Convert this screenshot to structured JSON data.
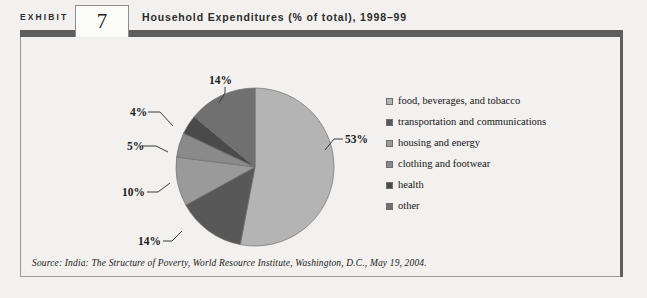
{
  "header": {
    "exhibit_word": "EXHIBIT",
    "exhibit_number": "7",
    "title": "Household Expenditures (% of total), 1998–99"
  },
  "source": {
    "text": "Source: India: The Structure of Poverty, World Resource Institute, Washington, D.C., May 19, 2004."
  },
  "colors": {
    "rule": "#5e5e5e",
    "frame_border": "#9a9a9a",
    "page_bg": "#f2f1ef",
    "text": "#1b1b1b",
    "slice_food": "#b4b4b4",
    "slice_transportation": "#585858",
    "slice_housing": "#9a9a9a",
    "slice_clothing": "#8a8a8a",
    "slice_health": "#4a4a4a",
    "slice_other": "#707070"
  },
  "chart_data": {
    "type": "pie",
    "title": "Household Expenditures (% of total), 1998–99",
    "legend_position": "right",
    "start_angle_deg": 0,
    "direction": "clockwise",
    "categories": [
      "food, beverages, and tobacco",
      "transportation and communications",
      "housing and energy",
      "clothing and footwear",
      "health",
      "other"
    ],
    "values": [
      53,
      14,
      10,
      5,
      4,
      14
    ],
    "value_labels": [
      "53%",
      "14%",
      "10%",
      "5%",
      "4%",
      "14%"
    ],
    "colors": [
      "#b4b4b4",
      "#585858",
      "#9a9a9a",
      "#8a8a8a",
      "#4a4a4a",
      "#707070"
    ],
    "units": "percent of total",
    "total": 100
  },
  "legend": {
    "items": [
      {
        "label": "food, beverages, and tobacco",
        "color": "#b4b4b4"
      },
      {
        "label": "transportation and communications",
        "color": "#585858"
      },
      {
        "label": "housing and energy",
        "color": "#9a9a9a"
      },
      {
        "label": "clothing and footwear",
        "color": "#8a8a8a"
      },
      {
        "label": "health",
        "color": "#4a4a4a"
      },
      {
        "label": "other",
        "color": "#707070"
      }
    ]
  }
}
